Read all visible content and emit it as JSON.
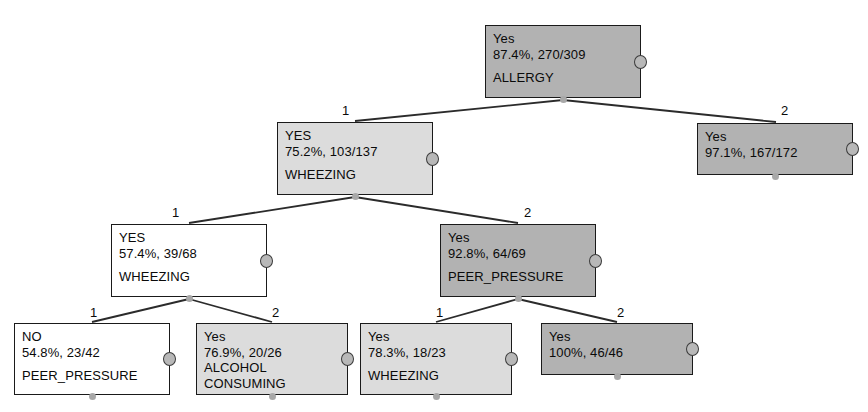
{
  "diagram": {
    "type": "decision-tree",
    "background_color": "#ffffff",
    "node_fill_gray": "#b2b2b2",
    "node_fill_light": "#dcdcdc",
    "node_fill_white": "#ffffff",
    "node_border_color": "#1a1a1a",
    "edge_color": "#2b2b2b"
  },
  "nodes": [
    {
      "id": "root",
      "class_label": "Yes",
      "stat": "87.4%, 270/309",
      "attribute": "ALLERGY",
      "attribute_line2": "",
      "fill": "gray",
      "x": 485,
      "y": 25,
      "w": 156,
      "h": 73
    },
    {
      "id": "n-wheezing-1",
      "class_label": "YES",
      "stat": "75.2%, 103/137",
      "attribute": "WHEEZING",
      "attribute_line2": "",
      "fill": "light",
      "x": 277,
      "y": 122,
      "w": 156,
      "h": 73
    },
    {
      "id": "n-leaf-97",
      "class_label": "Yes",
      "stat": "97.1%, 167/172",
      "attribute": "",
      "attribute_line2": "",
      "fill": "gray",
      "x": 697,
      "y": 123,
      "w": 156,
      "h": 52
    },
    {
      "id": "n-wheezing-2",
      "class_label": "YES",
      "stat": "57.4%, 39/68",
      "attribute": "WHEEZING",
      "attribute_line2": "",
      "fill": "white",
      "x": 111,
      "y": 224,
      "w": 156,
      "h": 73
    },
    {
      "id": "n-peer-pressure",
      "class_label": "Yes",
      "stat": "92.8%, 64/69",
      "attribute": "PEER_PRESSURE",
      "attribute_line2": "",
      "fill": "gray",
      "x": 440,
      "y": 224,
      "w": 156,
      "h": 73
    },
    {
      "id": "n-leaf-no",
      "class_label": "NO",
      "stat": "54.8%, 23/42",
      "attribute": "PEER_PRESSURE",
      "attribute_line2": "",
      "fill": "white",
      "x": 14,
      "y": 323,
      "w": 156,
      "h": 72
    },
    {
      "id": "n-leaf-alcohol",
      "class_label": "Yes",
      "stat": "76.9%, 20/26",
      "attribute": "ALCOHOL",
      "attribute_line2": "CONSUMING",
      "fill": "light",
      "x": 196,
      "y": 323,
      "w": 152,
      "h": 72
    },
    {
      "id": "n-leaf-wheezing",
      "class_label": "Yes",
      "stat": "78.3%, 18/23",
      "attribute": "WHEEZING",
      "attribute_line2": "",
      "fill": "light",
      "x": 360,
      "y": 323,
      "w": 152,
      "h": 72
    },
    {
      "id": "n-leaf-100",
      "class_label": "Yes",
      "stat": "100%, 46/46",
      "attribute": "",
      "attribute_line2": "",
      "fill": "gray",
      "x": 541,
      "y": 323,
      "w": 152,
      "h": 52
    }
  ],
  "edges": [
    {
      "from": "root",
      "to": "n-wheezing-1",
      "label": "1",
      "lx": 342,
      "ly": 104,
      "x1": 563,
      "y1": 100,
      "x2": 355,
      "y2": 121
    },
    {
      "from": "root",
      "to": "n-leaf-97",
      "label": "2",
      "lx": 781,
      "ly": 104,
      "x1": 563,
      "y1": 100,
      "x2": 776,
      "y2": 122
    },
    {
      "from": "n-wheezing-1",
      "to": "n-wheezing-2",
      "label": "1",
      "lx": 172,
      "ly": 206,
      "x1": 355,
      "y1": 197,
      "x2": 189,
      "y2": 223
    },
    {
      "from": "n-wheezing-1",
      "to": "n-peer-pressure",
      "label": "2",
      "lx": 524,
      "ly": 206,
      "x1": 355,
      "y1": 197,
      "x2": 518,
      "y2": 223
    },
    {
      "from": "n-wheezing-2",
      "to": "n-leaf-no",
      "label": "1",
      "lx": 90,
      "ly": 306,
      "x1": 189,
      "y1": 299,
      "x2": 92,
      "y2": 322
    },
    {
      "from": "n-wheezing-2",
      "to": "n-leaf-alcohol",
      "label": "2",
      "lx": 272,
      "ly": 306,
      "x1": 189,
      "y1": 299,
      "x2": 272,
      "y2": 322
    },
    {
      "from": "n-peer-pressure",
      "to": "n-leaf-wheezing",
      "label": "1",
      "lx": 436,
      "ly": 306,
      "x1": 518,
      "y1": 299,
      "x2": 436,
      "y2": 322
    },
    {
      "from": "n-peer-pressure",
      "to": "n-leaf-100",
      "label": "2",
      "lx": 617,
      "ly": 306,
      "x1": 518,
      "y1": 299,
      "x2": 617,
      "y2": 322
    }
  ]
}
